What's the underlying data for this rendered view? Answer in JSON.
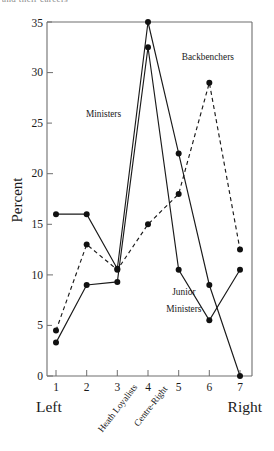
{
  "top_bleed_text": "and their careers",
  "chart_data": {
    "type": "line",
    "title": "",
    "xlabel": "",
    "ylabel": "Percent",
    "x": [
      1,
      2,
      3,
      4,
      5,
      6,
      7
    ],
    "xtick_labels": [
      "1",
      "2",
      "3",
      "4",
      "5",
      "6",
      "7"
    ],
    "ytick_labels": [
      "0",
      "5",
      "10",
      "15",
      "20",
      "25",
      "30",
      "35"
    ],
    "ytick_values": [
      0,
      5,
      10,
      15,
      20,
      25,
      30,
      35
    ],
    "ylim": [
      0,
      35
    ],
    "xlim": [
      0.62,
      7.38
    ],
    "grid": false,
    "legend_position": "inline-annotations",
    "axis_end_labels": {
      "left": "Left",
      "right": "Right"
    },
    "category_annotations": [
      {
        "label": "Heath Loyalists",
        "x": 3
      },
      {
        "label": "Centre-Right",
        "x": 4
      }
    ],
    "series": [
      {
        "name": "Ministers",
        "style": "solid",
        "values": [
          16,
          16,
          10.6,
          35,
          22,
          9,
          0
        ]
      },
      {
        "name": "Junior Ministers",
        "style": "solid",
        "values": [
          3.3,
          9,
          9.3,
          32.5,
          10.5,
          5.5,
          10.5
        ]
      },
      {
        "name": "Backbenchers",
        "style": "dashed",
        "values": [
          4.5,
          13,
          10.5,
          15,
          18,
          29,
          12.5
        ]
      }
    ],
    "annotations": [
      {
        "text": "Ministers",
        "x": 2.55,
        "y": 25.6
      },
      {
        "text": "Backbenchers",
        "x": 5.95,
        "y": 31.2
      },
      {
        "text": "Junior",
        "x": 5.17,
        "y": 8.0
      },
      {
        "text": "Ministers",
        "x": 5.17,
        "y": 6.35
      }
    ]
  }
}
